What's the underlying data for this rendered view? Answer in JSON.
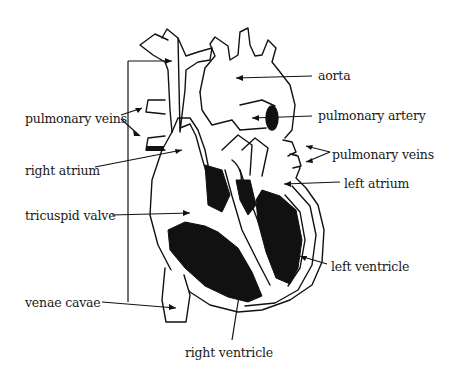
{
  "diagram": {
    "colors": {
      "ink": "#111111",
      "background": "#ffffff"
    },
    "labels": [
      {
        "id": "aorta",
        "text": "aorta",
        "x": 318,
        "y": 70
      },
      {
        "id": "pulmonary-artery",
        "text": "pulmonary artery",
        "x": 318,
        "y": 110
      },
      {
        "id": "pulmonary-veins-right",
        "text": "pulmonary veins",
        "x": 332,
        "y": 149
      },
      {
        "id": "left-atrium",
        "text": "left atrium",
        "x": 344,
        "y": 178
      },
      {
        "id": "left-ventricle",
        "text": "left ventricle",
        "x": 331,
        "y": 261
      },
      {
        "id": "right-ventricle",
        "text": "right ventricle",
        "x": 185,
        "y": 347
      },
      {
        "id": "pulmonary-veins-left",
        "text": "pulmonary veins",
        "x": 25,
        "y": 113
      },
      {
        "id": "right-atrium",
        "text": "right atrium",
        "x": 25,
        "y": 165
      },
      {
        "id": "tricuspid-valve",
        "text": "tricuspid valve",
        "x": 25,
        "y": 210
      },
      {
        "id": "venae-cavae",
        "text": "venae cavae",
        "x": 25,
        "y": 302
      }
    ]
  }
}
